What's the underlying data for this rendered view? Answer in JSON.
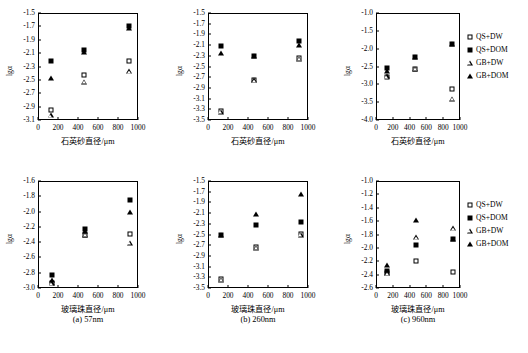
{
  "figure": {
    "legend": [
      {
        "label": "QS+DW",
        "marker": "square-open"
      },
      {
        "label": "QS+DOM",
        "marker": "square-filled"
      },
      {
        "label": "GB+DW",
        "marker": "triangle-open"
      },
      {
        "label": "GB+DOM",
        "marker": "triangle-filled"
      }
    ],
    "captions": [
      {
        "id": "a",
        "text": "(a) 57nm"
      },
      {
        "id": "b",
        "text": "(b) 260nm"
      },
      {
        "id": "c",
        "text": "(c) 960nm"
      }
    ]
  },
  "chart_data": [
    {
      "panel_id": "top-left",
      "type": "scatter",
      "title": "",
      "xlabel": "石英砂直径/μm",
      "ylabel": "lgα",
      "xlim": [
        0,
        1000
      ],
      "ylim": [
        -3.1,
        -1.5
      ],
      "xticks": [
        0,
        200,
        400,
        600,
        800,
        1000
      ],
      "yticks": [
        -1.5,
        -1.7,
        -1.9,
        -2.1,
        -2.3,
        -2.5,
        -2.7,
        -2.9,
        -3.1
      ],
      "grid": false,
      "legend_position": "none",
      "x": [
        125,
        460,
        910
      ],
      "series": [
        {
          "name": "QS+DW",
          "marker": "square-open",
          "values": [
            -2.95,
            -2.43,
            -2.22
          ]
        },
        {
          "name": "QS+DOM",
          "marker": "square-filled",
          "values": [
            -2.22,
            -2.05,
            -1.7
          ]
        },
        {
          "name": "GB+DW",
          "marker": "triangle-open",
          "values": [
            -3.03,
            -2.53,
            -2.37
          ]
        },
        {
          "name": "GB+DOM",
          "marker": "triangle-filled",
          "values": [
            -2.47,
            -2.08,
            -1.72
          ]
        }
      ]
    },
    {
      "panel_id": "top-middle",
      "type": "scatter",
      "title": "",
      "xlabel": "石英砂直径/μm",
      "ylabel": "lgα",
      "xlim": [
        0,
        1000
      ],
      "ylim": [
        -3.5,
        -1.5
      ],
      "xticks": [
        0,
        200,
        400,
        600,
        800,
        1000
      ],
      "yticks": [
        -1.5,
        -1.7,
        -1.9,
        -2.1,
        -2.3,
        -2.5,
        -2.7,
        -2.9,
        -3.1,
        -3.3,
        -3.5
      ],
      "grid": false,
      "legend_position": "none",
      "x": [
        125,
        460,
        910
      ],
      "series": [
        {
          "name": "QS+DW",
          "marker": "square-open",
          "values": [
            -3.34,
            -2.75,
            -2.35
          ]
        },
        {
          "name": "QS+DOM",
          "marker": "square-filled",
          "values": [
            -2.12,
            -2.3,
            -2.03
          ]
        },
        {
          "name": "GB+DW",
          "marker": "triangle-open",
          "values": [
            -3.35,
            -2.76,
            -2.36
          ]
        },
        {
          "name": "GB+DOM",
          "marker": "triangle-filled",
          "values": [
            -2.24,
            -2.3,
            -2.1
          ]
        }
      ]
    },
    {
      "panel_id": "top-right",
      "type": "scatter",
      "title": "",
      "xlabel": "石英砂直径/μm",
      "ylabel": "lgα",
      "xlim": [
        0,
        1000
      ],
      "ylim": [
        -4.0,
        -1.0
      ],
      "xticks": [
        0,
        200,
        400,
        600,
        800,
        1000
      ],
      "yticks": [
        -1.0,
        -1.5,
        -2.0,
        -2.5,
        -3.0,
        -3.5,
        -4.0
      ],
      "grid": false,
      "legend_position": "right",
      "x": [
        125,
        460,
        910
      ],
      "series": [
        {
          "name": "QS+DW",
          "marker": "square-open",
          "values": [
            -2.8,
            -2.57,
            -3.12
          ]
        },
        {
          "name": "QS+DOM",
          "marker": "square-filled",
          "values": [
            -2.53,
            -2.22,
            -1.87
          ]
        },
        {
          "name": "GB+DW",
          "marker": "triangle-open",
          "values": [
            -2.78,
            -2.56,
            -3.4
          ]
        },
        {
          "name": "GB+DOM",
          "marker": "triangle-filled",
          "values": [
            -2.62,
            -2.24,
            -1.88
          ]
        }
      ]
    },
    {
      "panel_id": "bottom-left",
      "type": "scatter",
      "title": "",
      "xlabel": "玻璃珠直径/μm",
      "ylabel": "lgα",
      "xlim": [
        0,
        1000
      ],
      "ylim": [
        -3.0,
        -1.6
      ],
      "xticks": [
        0,
        200,
        400,
        600,
        800,
        1000
      ],
      "yticks": [
        -1.6,
        -1.8,
        -2.0,
        -2.2,
        -2.4,
        -2.6,
        -2.8,
        -3.0
      ],
      "grid": false,
      "legend_position": "none",
      "x": [
        135,
        470,
        915
      ],
      "series": [
        {
          "name": "QS+DW",
          "marker": "square-open",
          "values": [
            -2.93,
            -2.3,
            -2.29
          ]
        },
        {
          "name": "QS+DOM",
          "marker": "square-filled",
          "values": [
            -2.83,
            -2.23,
            -1.85
          ]
        },
        {
          "name": "GB+DW",
          "marker": "triangle-open",
          "values": [
            -2.94,
            -2.3,
            -2.41
          ]
        },
        {
          "name": "GB+DOM",
          "marker": "triangle-filled",
          "values": [
            -2.9,
            -2.26,
            -2.01
          ]
        }
      ]
    },
    {
      "panel_id": "bottom-middle",
      "type": "scatter",
      "title": "",
      "xlabel": "玻璃珠直径/μm",
      "ylabel": "lgα",
      "xlim": [
        0,
        1000
      ],
      "ylim": [
        -3.5,
        -1.5
      ],
      "xticks": [
        0,
        200,
        400,
        600,
        800,
        1000
      ],
      "yticks": [
        -1.5,
        -1.7,
        -1.9,
        -2.1,
        -2.3,
        -2.5,
        -2.7,
        -2.9,
        -3.1,
        -3.3,
        -3.5
      ],
      "grid": false,
      "legend_position": "none",
      "x": [
        130,
        480,
        925
      ],
      "series": [
        {
          "name": "QS+DW",
          "marker": "square-open",
          "values": [
            -3.34,
            -2.73,
            -2.49
          ]
        },
        {
          "name": "QS+DOM",
          "marker": "square-filled",
          "values": [
            -2.51,
            -2.32,
            -2.27
          ]
        },
        {
          "name": "GB+DW",
          "marker": "triangle-open",
          "values": [
            -3.35,
            -2.75,
            -2.51
          ]
        },
        {
          "name": "GB+DOM",
          "marker": "triangle-filled",
          "values": [
            -2.51,
            -2.12,
            -1.75
          ]
        }
      ]
    },
    {
      "panel_id": "bottom-right",
      "type": "scatter",
      "title": "",
      "xlabel": "玻璃珠直径/μm",
      "ylabel": "lgα",
      "xlim": [
        0,
        1000
      ],
      "ylim": [
        -2.6,
        -1.0
      ],
      "xticks": [
        0,
        200,
        400,
        600,
        800,
        1000
      ],
      "yticks": [
        -1.0,
        -1.2,
        -1.4,
        -1.6,
        -1.8,
        -2.0,
        -2.2,
        -2.4,
        -2.6
      ],
      "grid": false,
      "legend_position": "right",
      "x": [
        135,
        475,
        915
      ],
      "series": [
        {
          "name": "QS+DW",
          "marker": "square-open",
          "values": [
            -2.37,
            -2.2,
            -2.36
          ]
        },
        {
          "name": "QS+DOM",
          "marker": "square-filled",
          "values": [
            -2.34,
            -1.95,
            -1.87
          ]
        },
        {
          "name": "GB+DW",
          "marker": "triangle-open",
          "values": [
            -2.38,
            -1.84,
            -1.71
          ]
        },
        {
          "name": "GB+DOM",
          "marker": "triangle-filled",
          "values": [
            -2.25,
            -1.58,
            -1.87
          ]
        }
      ]
    }
  ]
}
